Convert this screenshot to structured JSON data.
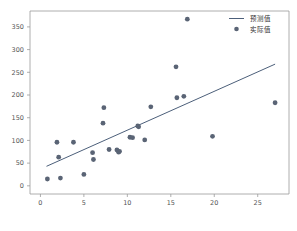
{
  "chart_data": {
    "type": "scatter",
    "title": "",
    "xlabel": "",
    "ylabel": "",
    "xlim": [
      -1.2,
      28.6
    ],
    "ylim": [
      -18,
      385
    ],
    "xticks": [
      0,
      5,
      10,
      15,
      20,
      25
    ],
    "yticks": [
      0,
      50,
      100,
      150,
      200,
      250,
      300,
      350
    ],
    "grid": false,
    "legend_position": "upper right",
    "series": [
      {
        "name": "预测值",
        "type": "line",
        "color": "#4c5f7a",
        "x": [
          0.7,
          27.0
        ],
        "y": [
          43,
          268
        ]
      },
      {
        "name": "实际值",
        "type": "scatter",
        "color": "#5a6475",
        "points": [
          [
            0.8,
            15
          ],
          [
            1.9,
            96
          ],
          [
            2.1,
            63
          ],
          [
            2.3,
            17
          ],
          [
            3.8,
            96
          ],
          [
            5.0,
            25
          ],
          [
            6.0,
            73
          ],
          [
            6.1,
            58
          ],
          [
            7.2,
            138
          ],
          [
            7.3,
            172
          ],
          [
            7.9,
            80
          ],
          [
            8.8,
            79
          ],
          [
            9.0,
            74
          ],
          [
            9.1,
            76
          ],
          [
            10.3,
            107
          ],
          [
            10.6,
            106
          ],
          [
            11.2,
            132
          ],
          [
            11.3,
            130
          ],
          [
            12.0,
            101
          ],
          [
            12.7,
            174
          ],
          [
            15.6,
            262
          ],
          [
            15.7,
            194
          ],
          [
            16.5,
            197
          ],
          [
            16.9,
            367
          ],
          [
            19.8,
            109
          ],
          [
            27.0,
            183
          ]
        ]
      }
    ]
  },
  "legend": {
    "entries": [
      {
        "label": "预测值",
        "marker": "line"
      },
      {
        "label": "实际值",
        "marker": "dot"
      }
    ]
  },
  "axes": {
    "x_tick_labels": [
      "0",
      "5",
      "10",
      "15",
      "20",
      "25"
    ],
    "y_tick_labels": [
      "0",
      "50",
      "100",
      "150",
      "200",
      "250",
      "300",
      "350"
    ]
  },
  "colors": {
    "line": "#4c5f7a",
    "marker": "#5a6475",
    "spine": "#9a9a9a",
    "tick_text": "#555555",
    "background": "#ffffff"
  }
}
